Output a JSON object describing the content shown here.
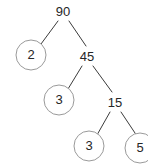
{
  "figure": {
    "background_color": "#ffffff",
    "line_color": "#3b3b3b",
    "circle_stroke_color": "#9a9a9a",
    "text_color": "#262626"
  },
  "chart_data": {
    "type": "diagram",
    "diagram_kind": "factor-tree",
    "title": "",
    "root": 90,
    "nodes": [
      {
        "id": "n90",
        "label": "90",
        "value": 90,
        "shape": "plain",
        "x": 63,
        "y": 12,
        "leaf": false
      },
      {
        "id": "n2",
        "label": "2",
        "value": 2,
        "shape": "circle",
        "x": 31,
        "y": 55,
        "r": 15,
        "leaf": true
      },
      {
        "id": "n45",
        "label": "45",
        "value": 45,
        "shape": "plain",
        "x": 87,
        "y": 57,
        "leaf": false
      },
      {
        "id": "n3a",
        "label": "3",
        "value": 3,
        "shape": "circle",
        "x": 59,
        "y": 100,
        "r": 15,
        "leaf": true
      },
      {
        "id": "n15",
        "label": "15",
        "value": 15,
        "shape": "plain",
        "x": 115,
        "y": 103,
        "leaf": false
      },
      {
        "id": "n3b",
        "label": "3",
        "value": 3,
        "shape": "circle",
        "x": 89,
        "y": 146,
        "r": 15,
        "leaf": true
      },
      {
        "id": "n5",
        "label": "5",
        "value": 5,
        "shape": "circle",
        "x": 140,
        "y": 148,
        "r": 15,
        "leaf": true
      }
    ],
    "edges": [
      {
        "from": "n90",
        "to": "n2",
        "x1": 58,
        "y1": 21,
        "x2": 41,
        "y2": 44
      },
      {
        "from": "n90",
        "to": "n45",
        "x1": 69,
        "y1": 21,
        "x2": 86,
        "y2": 46
      },
      {
        "from": "n45",
        "to": "n3a",
        "x1": 82,
        "y1": 66,
        "x2": 68,
        "y2": 89
      },
      {
        "from": "n45",
        "to": "n15",
        "x1": 93,
        "y1": 66,
        "x2": 112,
        "y2": 92
      },
      {
        "from": "n15",
        "to": "n3b",
        "x1": 110,
        "y1": 112,
        "x2": 97,
        "y2": 135
      },
      {
        "from": "n15",
        "to": "n5",
        "x1": 121,
        "y1": 112,
        "x2": 137,
        "y2": 136
      }
    ],
    "factorization": [
      2,
      3,
      3,
      5
    ],
    "leaf_labels": [
      "2",
      "3",
      "3",
      "5"
    ],
    "annotations": []
  }
}
